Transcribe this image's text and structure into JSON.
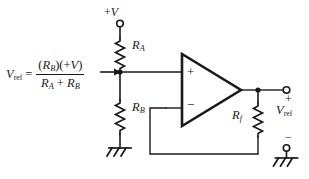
{
  "figure": {
    "type": "schematic",
    "background_color": "#ffffff",
    "line_color": "#1a1a1a",
    "text_color": "#1a1a1a"
  },
  "formula": {
    "lhs": "V",
    "lhs_subscript": "ref",
    "equals": "=",
    "numerator_open": "(",
    "numerator_r": "R",
    "numerator_r_subscript": "B",
    "numerator_mid": ")(+",
    "numerator_v": "V",
    "numerator_close": ")",
    "denominator_r1": "R",
    "denominator_r1_subscript": "A",
    "denominator_op": "+",
    "denominator_r2": "R",
    "denominator_r2_subscript": "B",
    "plain_text": "V_ref = (R_B)(+V) / (R_A + R_B)"
  },
  "supply": {
    "label_sign": "+",
    "label_v": "V",
    "terminal": "open-circle"
  },
  "components": {
    "ra": {
      "letter": "R",
      "subscript": "A",
      "type": "resistor"
    },
    "rb": {
      "letter": "R",
      "subscript": "B",
      "type": "resistor"
    },
    "rf": {
      "letter": "R",
      "subscript": "f",
      "type": "resistor"
    }
  },
  "opamp": {
    "noninverting_input": "+",
    "inverting_input": "−",
    "shape": "triangle"
  },
  "output": {
    "plus_sign": "+",
    "minus_sign": "−",
    "label_v": "V",
    "label_subscript": "ref",
    "terminal": "open-circle"
  },
  "grounds": {
    "left": "chassis-ground",
    "right": "chassis-ground"
  }
}
